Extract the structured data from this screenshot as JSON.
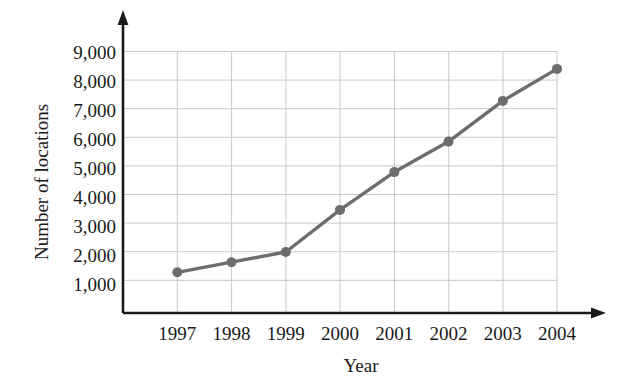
{
  "chart_data": {
    "type": "line",
    "title": "",
    "xlabel": "Year",
    "ylabel": "Number of locations",
    "categories": [
      "1997",
      "1998",
      "1999",
      "2000",
      "2001",
      "2002",
      "2003",
      "2004"
    ],
    "values": [
      1400,
      1750,
      2100,
      3550,
      4850,
      5900,
      7300,
      8400
    ],
    "series": [
      {
        "name": "Number of locations",
        "values": [
          1400,
          1750,
          2100,
          3550,
          4850,
          5900,
          7300,
          8400
        ]
      }
    ],
    "xtick_labels": [
      "1997",
      "1998",
      "1999",
      "2000",
      "2001",
      "2002",
      "2003",
      "2004"
    ],
    "ytick_labels": [
      "1,000",
      "2,000",
      "3,000",
      "4,000",
      "5,000",
      "6,000",
      "7,000",
      "8,000",
      "9,000"
    ],
    "ytick_values": [
      1000,
      2000,
      3000,
      4000,
      5000,
      6000,
      7000,
      8000,
      9000
    ],
    "ylim": [
      0,
      9000
    ],
    "grid": true,
    "legend": "none",
    "marker": "circle",
    "line_color": "#6d6d6d",
    "marker_color": "#6d6d6d",
    "grid_color": "#c9c9c9",
    "axis_color": "#1a1a1a",
    "text_color": "#1a1a1a"
  }
}
